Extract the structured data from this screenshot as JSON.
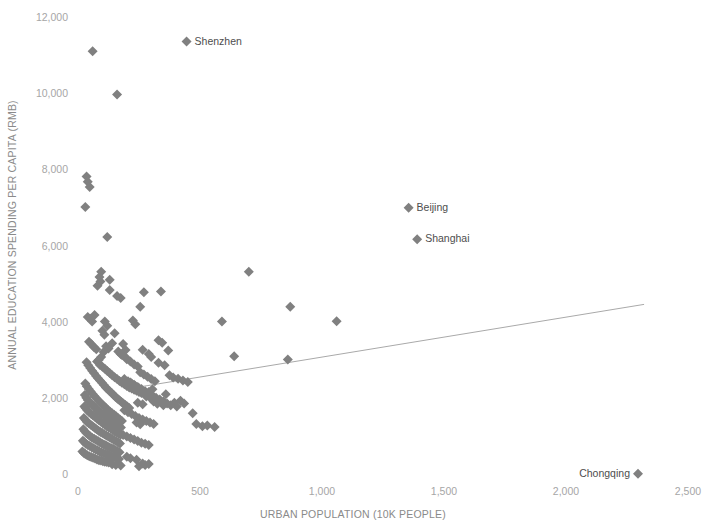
{
  "chart_data": {
    "type": "scatter",
    "title": "",
    "xlabel": "URBAN POPULATION (10K PEOPLE)",
    "ylabel": "ANNUAL EDUCATION SPENDING PER CAPITA (RMB)",
    "xlim": [
      0,
      2500
    ],
    "ylim": [
      0,
      12000
    ],
    "xticks": [
      0,
      500,
      1000,
      1500,
      2000,
      2500
    ],
    "xtick_labels": [
      "0",
      "500",
      "1,000",
      "1,500",
      "2,000",
      "2,500"
    ],
    "yticks": [
      0,
      2000,
      4000,
      6000,
      8000,
      10000,
      12000
    ],
    "ytick_labels": [
      "0",
      "2,000",
      "4,000",
      "6,000",
      "8,000",
      "10,000",
      "12,000"
    ],
    "grid": false,
    "legend": "none",
    "marker": "diamond",
    "marker_color": "#808080",
    "marker_size": 7,
    "trendline": {
      "color": "#a9a9a9",
      "x_start": 240,
      "y_start": 2300,
      "x_end": 2320,
      "y_end": 4480
    },
    "annotations": [
      {
        "label": "Shenzhen",
        "x": 445,
        "y": 11380,
        "label_side": "right"
      },
      {
        "label": "Beijing",
        "x": 1355,
        "y": 7020,
        "label_side": "right"
      },
      {
        "label": "Shanghai",
        "x": 1390,
        "y": 6190,
        "label_side": "right"
      },
      {
        "label": "Chongqing",
        "x": 2295,
        "y": 30,
        "label_side": "left"
      }
    ],
    "points": [
      [
        60,
        11130
      ],
      [
        160,
        9990
      ],
      [
        35,
        7840
      ],
      [
        40,
        7700
      ],
      [
        48,
        7560
      ],
      [
        30,
        7040
      ],
      [
        120,
        6250
      ],
      [
        95,
        5340
      ],
      [
        88,
        5200
      ],
      [
        92,
        5080
      ],
      [
        80,
        4970
      ],
      [
        700,
        5340
      ],
      [
        130,
        4860
      ],
      [
        270,
        4800
      ],
      [
        340,
        4820
      ],
      [
        255,
        4420
      ],
      [
        870,
        4420
      ],
      [
        40,
        4150
      ],
      [
        225,
        4060
      ],
      [
        235,
        3960
      ],
      [
        110,
        4030
      ],
      [
        120,
        3920
      ],
      [
        100,
        3790
      ],
      [
        108,
        3680
      ],
      [
        150,
        3720
      ],
      [
        1060,
        4040
      ],
      [
        590,
        4030
      ],
      [
        330,
        3540
      ],
      [
        345,
        3470
      ],
      [
        140,
        3460
      ],
      [
        185,
        3440
      ],
      [
        195,
        3280
      ],
      [
        265,
        3290
      ],
      [
        370,
        3270
      ],
      [
        290,
        3180
      ],
      [
        300,
        3100
      ],
      [
        115,
        3380
      ],
      [
        125,
        3320
      ],
      [
        105,
        3230
      ],
      [
        95,
        3100
      ],
      [
        85,
        3020
      ],
      [
        78,
        2980
      ],
      [
        90,
        2890
      ],
      [
        100,
        2840
      ],
      [
        110,
        2790
      ],
      [
        120,
        2730
      ],
      [
        130,
        2680
      ],
      [
        140,
        2620
      ],
      [
        150,
        2570
      ],
      [
        160,
        2520
      ],
      [
        170,
        2470
      ],
      [
        180,
        2420
      ],
      [
        190,
        2380
      ],
      [
        200,
        2340
      ],
      [
        210,
        2300
      ],
      [
        220,
        2270
      ],
      [
        230,
        2240
      ],
      [
        240,
        2210
      ],
      [
        250,
        2180
      ],
      [
        260,
        2150
      ],
      [
        640,
        3120
      ],
      [
        860,
        3030
      ],
      [
        35,
        2960
      ],
      [
        42,
        2880
      ],
      [
        50,
        2810
      ],
      [
        58,
        2740
      ],
      [
        66,
        2670
      ],
      [
        74,
        2600
      ],
      [
        82,
        2540
      ],
      [
        90,
        2480
      ],
      [
        98,
        2420
      ],
      [
        106,
        2360
      ],
      [
        114,
        2300
      ],
      [
        122,
        2250
      ],
      [
        130,
        2200
      ],
      [
        138,
        2150
      ],
      [
        146,
        2100
      ],
      [
        154,
        2050
      ],
      [
        162,
        2000
      ],
      [
        170,
        1960
      ],
      [
        178,
        1920
      ],
      [
        186,
        1880
      ],
      [
        194,
        1840
      ],
      [
        202,
        1800
      ],
      [
        210,
        1760
      ],
      [
        30,
        2400
      ],
      [
        36,
        2330
      ],
      [
        44,
        2260
      ],
      [
        52,
        2190
      ],
      [
        60,
        2130
      ],
      [
        68,
        2070
      ],
      [
        76,
        2010
      ],
      [
        84,
        1950
      ],
      [
        92,
        1900
      ],
      [
        100,
        1850
      ],
      [
        108,
        1800
      ],
      [
        116,
        1750
      ],
      [
        124,
        1700
      ],
      [
        132,
        1660
      ],
      [
        140,
        1620
      ],
      [
        148,
        1580
      ],
      [
        156,
        1540
      ],
      [
        164,
        1500
      ],
      [
        172,
        1460
      ],
      [
        180,
        1420
      ],
      [
        28,
        2100
      ],
      [
        34,
        2030
      ],
      [
        40,
        1970
      ],
      [
        48,
        1910
      ],
      [
        56,
        1860
      ],
      [
        64,
        1810
      ],
      [
        72,
        1760
      ],
      [
        80,
        1710
      ],
      [
        88,
        1660
      ],
      [
        96,
        1620
      ],
      [
        104,
        1580
      ],
      [
        112,
        1540
      ],
      [
        120,
        1500
      ],
      [
        128,
        1460
      ],
      [
        136,
        1420
      ],
      [
        144,
        1380
      ],
      [
        152,
        1350
      ],
      [
        160,
        1320
      ],
      [
        168,
        1280
      ],
      [
        176,
        1250
      ],
      [
        26,
        1800
      ],
      [
        32,
        1750
      ],
      [
        38,
        1700
      ],
      [
        46,
        1650
      ],
      [
        54,
        1600
      ],
      [
        62,
        1560
      ],
      [
        70,
        1520
      ],
      [
        78,
        1480
      ],
      [
        86,
        1440
      ],
      [
        94,
        1400
      ],
      [
        102,
        1360
      ],
      [
        110,
        1320
      ],
      [
        118,
        1280
      ],
      [
        126,
        1250
      ],
      [
        134,
        1220
      ],
      [
        142,
        1180
      ],
      [
        150,
        1150
      ],
      [
        158,
        1120
      ],
      [
        166,
        1090
      ],
      [
        174,
        1060
      ],
      [
        24,
        1500
      ],
      [
        30,
        1450
      ],
      [
        36,
        1400
      ],
      [
        44,
        1360
      ],
      [
        52,
        1320
      ],
      [
        60,
        1280
      ],
      [
        68,
        1240
      ],
      [
        76,
        1200
      ],
      [
        84,
        1160
      ],
      [
        92,
        1130
      ],
      [
        100,
        1100
      ],
      [
        108,
        1070
      ],
      [
        116,
        1040
      ],
      [
        124,
        1010
      ],
      [
        132,
        980
      ],
      [
        140,
        950
      ],
      [
        148,
        920
      ],
      [
        156,
        890
      ],
      [
        164,
        860
      ],
      [
        172,
        830
      ],
      [
        22,
        1200
      ],
      [
        28,
        1150
      ],
      [
        34,
        1100
      ],
      [
        42,
        1060
      ],
      [
        50,
        1020
      ],
      [
        58,
        980
      ],
      [
        66,
        950
      ],
      [
        74,
        920
      ],
      [
        82,
        890
      ],
      [
        90,
        860
      ],
      [
        98,
        830
      ],
      [
        106,
        800
      ],
      [
        114,
        780
      ],
      [
        122,
        750
      ],
      [
        130,
        720
      ],
      [
        138,
        700
      ],
      [
        146,
        680
      ],
      [
        154,
        650
      ],
      [
        162,
        630
      ],
      [
        170,
        600
      ],
      [
        20,
        900
      ],
      [
        26,
        860
      ],
      [
        32,
        820
      ],
      [
        40,
        790
      ],
      [
        48,
        760
      ],
      [
        56,
        730
      ],
      [
        64,
        700
      ],
      [
        72,
        670
      ],
      [
        80,
        650
      ],
      [
        88,
        620
      ],
      [
        96,
        600
      ],
      [
        104,
        580
      ],
      [
        112,
        560
      ],
      [
        120,
        540
      ],
      [
        128,
        520
      ],
      [
        136,
        500
      ],
      [
        144,
        480
      ],
      [
        152,
        460
      ],
      [
        160,
        440
      ],
      [
        168,
        420
      ],
      [
        18,
        620
      ],
      [
        24,
        580
      ],
      [
        30,
        550
      ],
      [
        38,
        520
      ],
      [
        46,
        490
      ],
      [
        54,
        470
      ],
      [
        62,
        450
      ],
      [
        70,
        430
      ],
      [
        78,
        410
      ],
      [
        86,
        390
      ],
      [
        94,
        380
      ],
      [
        102,
        360
      ],
      [
        110,
        350
      ],
      [
        118,
        340
      ],
      [
        126,
        330
      ],
      [
        200,
        480
      ],
      [
        215,
        440
      ],
      [
        240,
        400
      ],
      [
        265,
        300
      ],
      [
        290,
        290
      ],
      [
        240,
        1380
      ],
      [
        255,
        1330
      ],
      [
        245,
        1900
      ],
      [
        265,
        1860
      ],
      [
        280,
        2060
      ],
      [
        300,
        2000
      ],
      [
        310,
        1930
      ],
      [
        325,
        1870
      ],
      [
        290,
        2180
      ],
      [
        305,
        2250
      ],
      [
        350,
        1830
      ],
      [
        360,
        2120
      ],
      [
        395,
        1900
      ],
      [
        405,
        1800
      ],
      [
        420,
        1950
      ],
      [
        435,
        1880
      ],
      [
        470,
        1620
      ],
      [
        485,
        1340
      ],
      [
        510,
        1280
      ],
      [
        530,
        1300
      ],
      [
        560,
        1260
      ],
      [
        330,
        2950
      ],
      [
        355,
        2880
      ],
      [
        375,
        2620
      ],
      [
        390,
        2560
      ],
      [
        410,
        2530
      ],
      [
        430,
        2480
      ],
      [
        450,
        2440
      ],
      [
        255,
        2700
      ],
      [
        270,
        2640
      ],
      [
        285,
        2580
      ],
      [
        300,
        2520
      ],
      [
        315,
        2460
      ],
      [
        200,
        3040
      ],
      [
        215,
        2980
      ],
      [
        230,
        2900
      ],
      [
        245,
        2850
      ],
      [
        180,
        3150
      ],
      [
        195,
        3090
      ],
      [
        165,
        3240
      ],
      [
        175,
        3180
      ],
      [
        215,
        2430
      ],
      [
        230,
        2370
      ],
      [
        245,
        2310
      ],
      [
        260,
        2260
      ],
      [
        275,
        2200
      ],
      [
        290,
        2140
      ],
      [
        305,
        2090
      ],
      [
        320,
        2030
      ],
      [
        335,
        1980
      ],
      [
        350,
        1930
      ],
      [
        365,
        1880
      ],
      [
        380,
        1830
      ],
      [
        190,
        2520
      ],
      [
        205,
        2460
      ],
      [
        220,
        2400
      ],
      [
        235,
        2340
      ],
      [
        250,
        2280
      ],
      [
        190,
        1700
      ],
      [
        205,
        1650
      ],
      [
        220,
        1600
      ],
      [
        235,
        1550
      ],
      [
        250,
        1500
      ],
      [
        265,
        1460
      ],
      [
        280,
        1420
      ],
      [
        295,
        1380
      ],
      [
        310,
        1340
      ],
      [
        185,
        1050
      ],
      [
        200,
        1010
      ],
      [
        215,
        970
      ],
      [
        230,
        930
      ],
      [
        245,
        890
      ],
      [
        260,
        850
      ],
      [
        275,
        820
      ],
      [
        290,
        790
      ],
      [
        140,
        280
      ],
      [
        155,
        260
      ],
      [
        175,
        250
      ],
      [
        250,
        230
      ],
      [
        275,
        260
      ],
      [
        45,
        3500
      ],
      [
        55,
        3430
      ],
      [
        65,
        3360
      ],
      [
        75,
        3300
      ],
      [
        68,
        4200
      ],
      [
        50,
        4100
      ],
      [
        58,
        4030
      ],
      [
        130,
        5130
      ],
      [
        160,
        4700
      ],
      [
        175,
        4650
      ]
    ]
  }
}
